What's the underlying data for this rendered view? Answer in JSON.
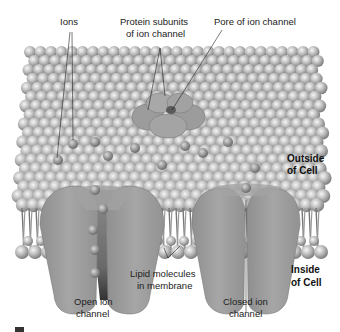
{
  "labels": {
    "ions": "Ions",
    "protein_subunits_line1": "Protein subunits",
    "protein_subunits_line2": "of ion channel",
    "pore": "Pore of ion channel",
    "outside_line1": "Outside",
    "outside_line2": "of Cell",
    "inside_line1": "Inside",
    "inside_line2": "of Cell",
    "lipid_line1": "Lipid molecules",
    "lipid_line2": "in membrane",
    "open_line1": "Open ion",
    "open_line2": "channel",
    "closed_line1": "Closed ion",
    "closed_line2": "channel"
  },
  "colors": {
    "background": "#ffffff",
    "lipid_head": "#bdbdbd",
    "lipid_highlight": "#f2f2f2",
    "lipid_shadow": "#8a8a8a",
    "protein": "#9a9a9a",
    "protein_light": "#b0b0b0",
    "pore_dark": "#4a4a4a",
    "ion": "#a8a8a8",
    "leader_line": "#222222",
    "text": "#222222"
  },
  "icons": {
    "corner_mark": "square-marker-icon"
  }
}
